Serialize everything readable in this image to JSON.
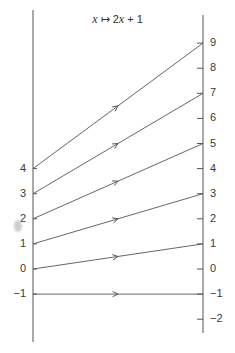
{
  "diagram": {
    "title": {
      "var1": "x",
      "arrow": "↦",
      "expr_prefix": "2",
      "var2": "x",
      "expr_suffix": "+ 1"
    },
    "left_axis": {
      "labels": [
        "4",
        "3",
        "2",
        "1",
        "0",
        "−1"
      ],
      "values": [
        4,
        3,
        2,
        1,
        0,
        -1
      ]
    },
    "right_axis": {
      "labels": [
        "9",
        "8",
        "7",
        "6",
        "5",
        "4",
        "3",
        "2",
        "1",
        "0",
        "−1",
        "−2"
      ],
      "values": [
        9,
        8,
        7,
        6,
        5,
        4,
        3,
        2,
        1,
        0,
        -1,
        -2
      ]
    },
    "mappings": [
      {
        "from": 4,
        "to": 9
      },
      {
        "from": 3,
        "to": 7
      },
      {
        "from": 2,
        "to": 5
      },
      {
        "from": 1,
        "to": 3
      },
      {
        "from": 0,
        "to": 1
      },
      {
        "from": -1,
        "to": -1
      }
    ],
    "colors": {
      "line": "#555555",
      "text": "#3a3a3a"
    }
  }
}
